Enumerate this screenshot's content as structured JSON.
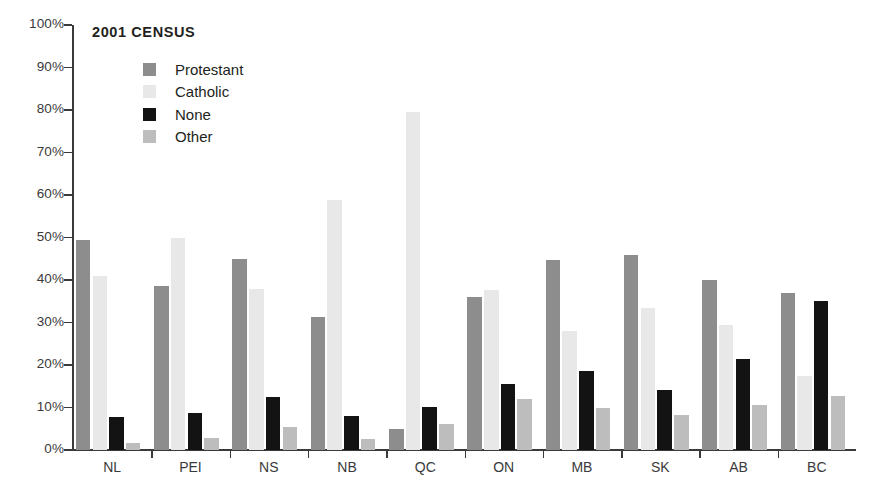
{
  "chart": {
    "title": "2001 CENSUS",
    "y_tick_suffix": "%"
  },
  "legend": {
    "items": [
      {
        "label": "Protestant",
        "key": "protestant",
        "color": "#8d8d8d",
        "swatch_name": "legend-swatch-protestant"
      },
      {
        "label": "Catholic",
        "key": "catholic",
        "color": "#e8e8e8",
        "swatch_name": "legend-swatch-catholic"
      },
      {
        "label": "None",
        "key": "none",
        "color": "#131313",
        "swatch_name": "legend-swatch-none"
      },
      {
        "label": "Other",
        "key": "other",
        "color": "#bdbdbd",
        "swatch_name": "legend-swatch-other"
      }
    ]
  },
  "chart_data": {
    "type": "bar",
    "title": "2001 CENSUS",
    "xlabel": "",
    "ylabel": "",
    "ylim": [
      0,
      100
    ],
    "ytick_labels": [
      "0%",
      "10%",
      "20%",
      "30%",
      "40%",
      "50%",
      "60%",
      "70%",
      "80%",
      "90%",
      "100%"
    ],
    "ytick_values": [
      0,
      10,
      20,
      30,
      40,
      50,
      60,
      70,
      80,
      90,
      100
    ],
    "grid": false,
    "legend_position": "inside-top-left",
    "categories": [
      "NL",
      "PEI",
      "NS",
      "NB",
      "QC",
      "ON",
      "MB",
      "SK",
      "AB",
      "BC"
    ],
    "series": [
      {
        "name": "Protestant",
        "color": "#8d8d8d",
        "values": [
          49.5,
          38.7,
          45.0,
          31.2,
          4.9,
          36.0,
          44.8,
          45.9,
          40.1,
          36.9
        ]
      },
      {
        "name": "Catholic",
        "color": "#e8e8e8",
        "values": [
          41.0,
          49.9,
          38.0,
          58.8,
          79.5,
          37.6,
          28.0,
          33.5,
          29.5,
          17.5
        ]
      },
      {
        "name": "None",
        "color": "#131313",
        "values": [
          7.8,
          8.7,
          12.4,
          8.0,
          10.1,
          15.6,
          18.6,
          14.2,
          21.3,
          35.0
        ]
      },
      {
        "name": "Other",
        "color": "#bdbdbd",
        "values": [
          1.7,
          2.8,
          5.3,
          2.6,
          6.1,
          11.9,
          9.8,
          8.2,
          10.6,
          12.6
        ]
      }
    ]
  }
}
